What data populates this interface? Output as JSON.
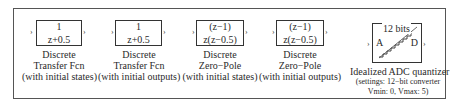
{
  "blocks": [
    {
      "id": "tf-states",
      "numerator": "1",
      "denominator": "z+0.5",
      "label": [
        "Discrete",
        "Transfer Fcn",
        "(with initial states)"
      ]
    },
    {
      "id": "tf-outputs",
      "numerator": "1",
      "denominator": "z+0.5",
      "label": [
        "Discrete",
        "Transfer Fcn",
        "(with initial outputs)"
      ]
    },
    {
      "id": "zp-states",
      "numerator": "(z−1)",
      "denominator": "z(z−0.5)",
      "label": [
        "Discrete",
        "Zero−Pole",
        "(with initial states)"
      ]
    },
    {
      "id": "zp-outputs",
      "numerator": "(z−1)",
      "denominator": "z(z−0.5)",
      "label": [
        "Discrete",
        "Zero−Pole",
        "(with initial outputs)"
      ]
    }
  ],
  "adc": {
    "bits_label": "12 bits",
    "input_port": "A",
    "output_port": "D",
    "title": "Idealized ADC quantizer",
    "settings_line1": "(settings: 12−bit converter",
    "settings_line2": "Vmin: 0, Vmax: 5)"
  },
  "ports": {
    "in_glyph": "›",
    "out_glyph": "›"
  }
}
